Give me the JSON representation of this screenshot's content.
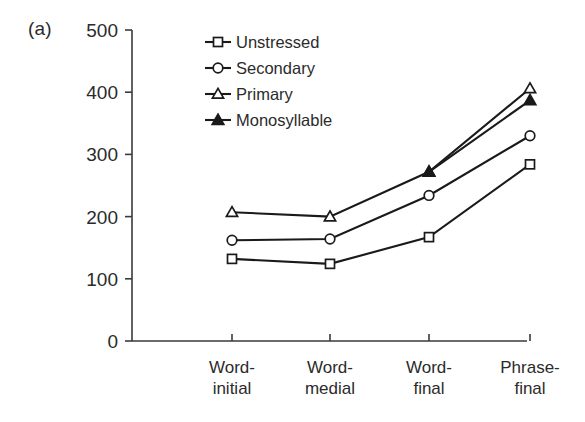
{
  "figure": {
    "panel_label": "(a)"
  },
  "chart_data": {
    "type": "line",
    "title": "",
    "xlabel": "",
    "ylabel": "",
    "ylim": [
      0,
      500
    ],
    "ytick_values": [
      0,
      100,
      200,
      300,
      400,
      500
    ],
    "ytick_labels": [
      "0",
      "100",
      "200",
      "300",
      "400",
      "500"
    ],
    "grid": false,
    "legend_position": "upper-left-inside",
    "categories": [
      "Word-initial",
      "Word-medial",
      "Word-final",
      "Phrase-final"
    ],
    "category_lines": [
      [
        "Word-",
        "initial"
      ],
      [
        "Word-",
        "medial"
      ],
      [
        "Word-",
        "final"
      ],
      [
        "Phrase-",
        "final"
      ]
    ],
    "series": [
      {
        "name": "Unstressed",
        "marker": "open-square",
        "values": [
          132,
          124,
          167,
          284
        ]
      },
      {
        "name": "Secondary",
        "marker": "open-circle",
        "values": [
          162,
          164,
          234,
          330
        ]
      },
      {
        "name": "Primary",
        "marker": "open-triangle",
        "values": [
          207,
          200,
          272,
          406
        ]
      },
      {
        "name": "Monosyllable",
        "marker": "filled-triangle",
        "values": [
          null,
          null,
          272,
          387
        ]
      }
    ]
  },
  "colors": {
    "line": "#1a1a1a",
    "axis": "#3a3a3a",
    "text": "#2b2b2b",
    "background": "#ffffff"
  }
}
